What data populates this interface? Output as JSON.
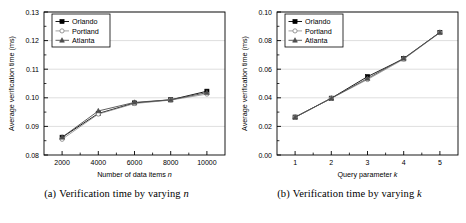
{
  "figure": {
    "panels": [
      {
        "id": "panel-a",
        "caption_label": "(a)",
        "caption_text": "Verification time by varying",
        "caption_var": "n"
      },
      {
        "id": "panel-b",
        "caption_label": "(b)",
        "caption_text": "Verification time by varying",
        "caption_var": "k"
      }
    ]
  },
  "colors": {
    "orlando": "#000000",
    "portland": "#8c8c8c",
    "atlanta": "#4d4d4d",
    "axis": "#000000",
    "grid": "#c8c8c8",
    "background": "#ffffff"
  },
  "chart_data": [
    {
      "type": "line",
      "id": "chart-a",
      "title": "",
      "xlabel": "Number of data items n",
      "xlabel_text": "Number of data items",
      "xlabel_var": "n",
      "ylabel": "Average verification time (ms)",
      "categories": [
        2000,
        4000,
        6000,
        8000,
        10000
      ],
      "xticklabels": [
        "2000",
        "4000",
        "6000",
        "8000",
        "10000"
      ],
      "yticklabels": [
        "0.08",
        "0.09",
        "0.10",
        "0.11",
        "0.12",
        "0.13"
      ],
      "yticks": [
        0.08,
        0.09,
        0.1,
        0.11,
        0.12,
        0.13
      ],
      "xlim": [
        1000,
        11000
      ],
      "ylim": [
        0.08,
        0.13
      ],
      "grid": true,
      "legend_position": "top-left",
      "series": [
        {
          "name": "Orlando",
          "marker": "square",
          "color": "#000000",
          "values": [
            0.0862,
            0.0945,
            0.0982,
            0.0993,
            0.1023
          ]
        },
        {
          "name": "Portland",
          "marker": "circle",
          "color": "#8c8c8c",
          "values": [
            0.0855,
            0.0943,
            0.098,
            0.0992,
            0.1013
          ]
        },
        {
          "name": "Atlanta",
          "marker": "triangle",
          "color": "#4d4d4d",
          "values": [
            0.0862,
            0.0954,
            0.0984,
            0.0993,
            0.1018
          ]
        }
      ]
    },
    {
      "type": "line",
      "id": "chart-b",
      "title": "",
      "xlabel": "Query parameter k",
      "xlabel_text": "Query parameter",
      "xlabel_var": "k",
      "ylabel": "Average verification time (ms)",
      "categories": [
        1,
        2,
        3,
        4,
        5
      ],
      "xticklabels": [
        "1",
        "2",
        "3",
        "4",
        "5"
      ],
      "yticklabels": [
        "0.00",
        "0.02",
        "0.04",
        "0.06",
        "0.08",
        "0.10"
      ],
      "yticks": [
        0.0,
        0.02,
        0.04,
        0.06,
        0.08,
        0.1
      ],
      "xlim": [
        0.5,
        5.5
      ],
      "ylim": [
        0.0,
        0.1
      ],
      "grid": true,
      "legend_position": "top-left",
      "series": [
        {
          "name": "Orlando",
          "marker": "square",
          "color": "#000000",
          "values": [
            0.0265,
            0.0397,
            0.0548,
            0.0673,
            0.0857
          ]
        },
        {
          "name": "Portland",
          "marker": "circle",
          "color": "#8c8c8c",
          "values": [
            0.0263,
            0.0396,
            0.0528,
            0.067,
            0.0855
          ]
        },
        {
          "name": "Atlanta",
          "marker": "triangle",
          "color": "#4d4d4d",
          "values": [
            0.0264,
            0.0397,
            0.0535,
            0.0676,
            0.0858
          ]
        }
      ]
    }
  ]
}
